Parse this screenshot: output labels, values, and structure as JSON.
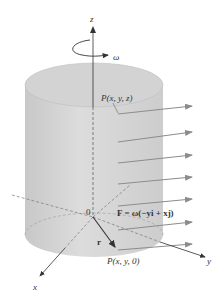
{
  "diagram": {
    "axes": {
      "z": "z",
      "x": "x",
      "y": "y",
      "origin": "0"
    },
    "rotation_label": "ω",
    "point_top": "P(x, y, z)",
    "point_bottom": "P(x, y, 0)",
    "radius_vector": "r",
    "field_equation": "F = ω(−yi + xj)",
    "colors": {
      "cylinder": "#d6d6d6",
      "cylinder_top": "#cfcfcf",
      "arrows": "#8c8c8c",
      "axes": "#333333"
    },
    "arrow_count": 7
  }
}
